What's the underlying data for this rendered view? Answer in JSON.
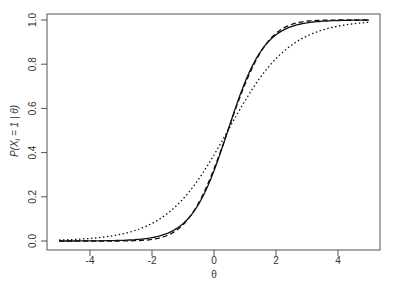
{
  "chart_data": {
    "type": "line",
    "title": "",
    "xlabel": "θ",
    "ylabel": "P(X_i = 1 | θ)",
    "xlim": [
      -5,
      5
    ],
    "ylim": [
      0,
      1
    ],
    "xticks": [
      "-4",
      "-2",
      "0",
      "2",
      "4"
    ],
    "yticks": [
      "0.0",
      "0.2",
      "0.4",
      "0.6",
      "0.8",
      "1.0"
    ],
    "grid": false,
    "legend": null,
    "series": [
      {
        "name": "solid",
        "style": "solid",
        "model": "logistic",
        "a": 1.7,
        "b": 0.45
      },
      {
        "name": "dashed",
        "style": "dashed",
        "model": "normal-ogive",
        "a": 1.0,
        "b": 0.45
      },
      {
        "name": "dotted",
        "style": "dotted",
        "model": "logistic",
        "a": 1.0,
        "b": 0.45
      }
    ]
  }
}
